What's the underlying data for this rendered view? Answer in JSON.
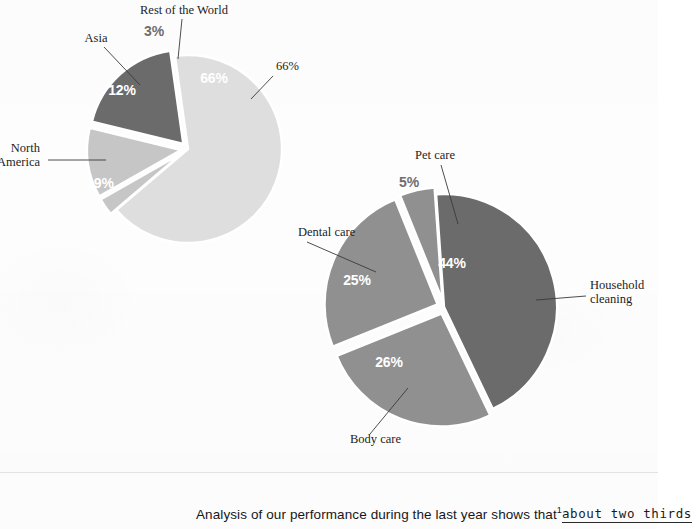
{
  "page": {
    "background_color": "#fdfdfd",
    "caption_prefix": "Analysis of our performance during the last year shows that",
    "caption_footnote_mark": "1",
    "caption_handwritten": "about two thirds"
  },
  "colors": {
    "very_light_gray": "#dedede",
    "light_gray": "#c6c6c6",
    "mid_gray": "#909090",
    "dark_gray": "#6b6b6b",
    "slice_outline": "#ffffff",
    "leader_line": "#3a3a3a",
    "label_text": "#1d1d1d",
    "percent_inside_text": "#ffffff",
    "percent_outside_text": "#6e6e6e"
  },
  "chart_data": [
    {
      "type": "pie",
      "id": "sales-by-region",
      "title": "",
      "legend_position": "none",
      "center": {
        "x": 188,
        "y": 149
      },
      "radius": 94,
      "start_angle_deg": -8,
      "categories": [
        "Europe",
        "Rest of the World",
        "Asia",
        "North America"
      ],
      "values": [
        66,
        3,
        12,
        19
      ],
      "labels": [
        "66%",
        "3%",
        "12%",
        "19%"
      ],
      "slices": [
        {
          "name": "Europe",
          "value": 66,
          "label": "66%",
          "color": "#dedede",
          "label_pos": {
            "x": 276,
            "y": 70
          },
          "label_anchor": "start",
          "pct_pos": {
            "x": 214,
            "y": 83
          },
          "pct_color": "#ffffff",
          "exploded": false,
          "leader": {
            "x1": 273,
            "y1": 76,
            "x2": 251,
            "y2": 99
          }
        },
        {
          "name": "Rest of the World",
          "value": 3,
          "label": "3%",
          "color": "#c6c6c6",
          "label_pos": {
            "x": 184,
            "y": 14
          },
          "label_anchor": "middle",
          "pct_pos": {
            "x": 154,
            "y": 36
          },
          "pct_color": "#6e6e6e",
          "exploded": true,
          "leader": {
            "x1": 182,
            "y1": 19,
            "x2": 178,
            "y2": 59
          }
        },
        {
          "name": "Asia",
          "value": 12,
          "label": "Asia",
          "color": "#c6c6c6",
          "label_pos": {
            "x": 96,
            "y": 42
          },
          "label_anchor": "middle",
          "pct_pos": {
            "x": 122,
            "y": 95
          },
          "pct_color": "#ffffff",
          "exploded": true,
          "leader": {
            "x1": 104,
            "y1": 47,
            "x2": 140,
            "y2": 85
          }
        },
        {
          "name": "North America",
          "value": 19,
          "label": "North America",
          "color": "#6b6b6b",
          "label_pos": {
            "x": 40,
            "y": 152
          },
          "label_anchor": "end",
          "pct_pos": {
            "x": 100,
            "y": 188
          },
          "pct_color": "#ffffff",
          "exploded": true,
          "leader": {
            "x1": 48,
            "y1": 160,
            "x2": 106,
            "y2": 160
          }
        }
      ]
    },
    {
      "type": "pie",
      "id": "sales-by-product-category",
      "title": "",
      "legend_position": "none",
      "center": {
        "x": 444,
        "y": 307
      },
      "radius": 113,
      "start_angle_deg": -4,
      "categories": [
        "Household cleaning",
        "Body care",
        "Dental care",
        "Pet care"
      ],
      "values": [
        44,
        26,
        25,
        5
      ],
      "labels": [
        "44%",
        "26%",
        "25%",
        "5%"
      ],
      "slices": [
        {
          "name": "Household cleaning",
          "value": 44,
          "label": "Household cleaning",
          "color": "#6b6b6b",
          "label_pos": {
            "x": 590,
            "y": 289
          },
          "label_anchor": "start",
          "pct_pos": {
            "x": 452,
            "y": 268
          },
          "pct_color": "#ffffff",
          "exploded": false,
          "leader": {
            "x1": 586,
            "y1": 296,
            "x2": 536,
            "y2": 300
          }
        },
        {
          "name": "Body care",
          "value": 26,
          "label": "Body care",
          "color": "#909090",
          "label_pos": {
            "x": 350,
            "y": 443
          },
          "label_anchor": "start",
          "pct_pos": {
            "x": 389,
            "y": 367
          },
          "pct_color": "#ffffff",
          "exploded": true,
          "leader": {
            "x1": 370,
            "y1": 434,
            "x2": 408,
            "y2": 388
          }
        },
        {
          "name": "Dental care",
          "value": 25,
          "label": "Dental care",
          "color": "#909090",
          "label_pos": {
            "x": 298,
            "y": 236
          },
          "label_anchor": "start",
          "pct_pos": {
            "x": 357,
            "y": 285
          },
          "pct_color": "#ffffff",
          "exploded": true,
          "leader": {
            "x1": 307,
            "y1": 242,
            "x2": 376,
            "y2": 272
          }
        },
        {
          "name": "Pet care",
          "value": 5,
          "label": "Pet care",
          "color": "#909090",
          "label_pos": {
            "x": 435,
            "y": 159
          },
          "label_anchor": "middle",
          "pct_pos": {
            "x": 409,
            "y": 187
          },
          "pct_color": "#6e6e6e",
          "exploded": true,
          "leader": {
            "x1": 441,
            "y1": 165,
            "x2": 458,
            "y2": 224
          }
        }
      ]
    }
  ]
}
